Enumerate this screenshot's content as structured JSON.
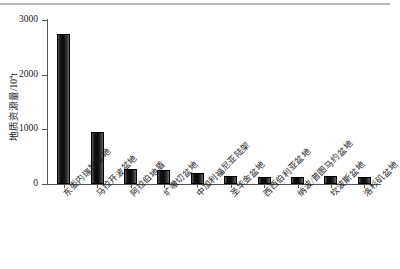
{
  "chart_data": {
    "type": "bar",
    "title": "",
    "xlabel": "",
    "ylabel": "地质资源量/10⁴t",
    "ylabel_base": "地质资源量/10",
    "ylabel_exp": "4",
    "ylabel_unit": "t",
    "ylim": [
      0,
      3000
    ],
    "yticks": [
      0,
      1000,
      2000,
      3000
    ],
    "ytick_labels": [
      "0",
      "1000",
      "2000",
      "3000"
    ],
    "grid": false,
    "legend": null,
    "bar_color": "#1c1c1c",
    "categories": [
      "东委内瑞拉盆地",
      "马拉开波盆地",
      "阿拉伯地盾",
      "圹嗷切盆地",
      "中加利福尼亚陆架",
      "圣华金盆地",
      "西西伯利亚盆地",
      "纳波/普图马约盆地",
      "坎波斯盆地",
      "洛杉矶盆地"
    ],
    "values": [
      2750,
      960,
      270,
      265,
      195,
      155,
      135,
      130,
      140,
      125
    ]
  }
}
